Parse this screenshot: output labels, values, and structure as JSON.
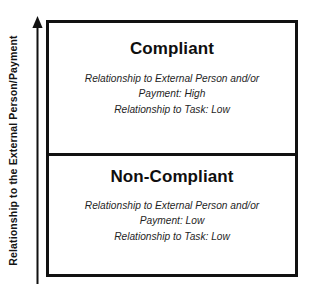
{
  "figure": {
    "type": "two-cell-matrix",
    "background_color": "#ffffff",
    "line_color": "#111111",
    "text_color": "#1a1a1a"
  },
  "axis": {
    "label": "Relationship to the External Person/Payment",
    "direction": "up",
    "arrow_icon": "up-arrow-icon"
  },
  "quadrants": [
    {
      "id": "compliant",
      "title": "Compliant",
      "lines": [
        "Relationship to External Person and/or",
        "Payment: High",
        "Relationship to Task: Low"
      ]
    },
    {
      "id": "non-compliant",
      "title": "Non-Compliant",
      "lines": [
        "Relationship to External Person and/or",
        "Payment: Low",
        "Relationship to Task: Low"
      ]
    }
  ]
}
